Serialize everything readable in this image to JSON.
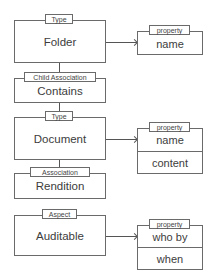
{
  "diagram": {
    "nodes": [
      {
        "id": "folder",
        "stereotype": "Type",
        "label": "Folder"
      },
      {
        "id": "contains",
        "stereotype": "Child Association",
        "label": "Contains"
      },
      {
        "id": "document",
        "stereotype": "Type",
        "label": "Document"
      },
      {
        "id": "rendition",
        "stereotype": "Association",
        "label": "Rendition"
      },
      {
        "id": "auditable",
        "stereotype": "Aspect",
        "label": "Auditable"
      }
    ],
    "property_groups": [
      {
        "owner": "folder",
        "stereotype": "property",
        "items": [
          "name"
        ]
      },
      {
        "owner": "document",
        "stereotype": "property",
        "items": [
          "name",
          "content"
        ]
      },
      {
        "owner": "auditable",
        "stereotype": "property",
        "items": [
          "who by",
          "when"
        ]
      }
    ],
    "edges": [
      {
        "from": "folder",
        "to": "contains",
        "kind": "line"
      },
      {
        "from": "contains",
        "to": "document",
        "kind": "line"
      },
      {
        "from": "document",
        "to": "rendition",
        "kind": "line"
      },
      {
        "from": "folder",
        "to": "folder-properties",
        "kind": "arrow"
      },
      {
        "from": "document",
        "to": "document-properties",
        "kind": "arrow"
      },
      {
        "from": "auditable",
        "to": "auditable-properties",
        "kind": "arrow"
      }
    ]
  }
}
